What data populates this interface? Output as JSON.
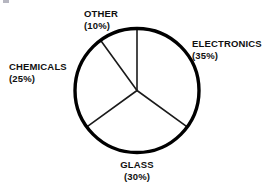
{
  "chart_data": {
    "type": "pie",
    "title": "",
    "subtitle": "",
    "xlabel": "",
    "ylabel": "",
    "legend_position": "none",
    "grid": false,
    "units": "percent",
    "start_angle_deg": 0,
    "direction": "clockwise",
    "categories": [
      "ELECTRONICS",
      "GLASS",
      "CHEMICALS",
      "OTHER"
    ],
    "values": [
      35,
      30,
      25,
      10
    ],
    "slices": [
      {
        "name": "ELECTRONICS",
        "value": 35,
        "label_name": "ELECTRONICS",
        "label_pct": "(35%)",
        "start_deg": 0,
        "end_deg": 126,
        "fill": "#ffffff"
      },
      {
        "name": "GLASS",
        "value": 30,
        "label_name": "GLASS",
        "label_pct": "(30%)",
        "start_deg": 126,
        "end_deg": 234,
        "fill": "#ffffff"
      },
      {
        "name": "CHEMICALS",
        "value": 25,
        "label_name": "CHEMICALS",
        "label_pct": "(25%)",
        "start_deg": 234,
        "end_deg": 324,
        "fill": "#ffffff"
      },
      {
        "name": "OTHER",
        "value": 10,
        "label_name": "OTHER",
        "label_pct": "(10%)",
        "start_deg": 324,
        "end_deg": 360,
        "fill": "#ffffff"
      }
    ],
    "colors": {
      "background": "#ffffff",
      "outline": "#000000",
      "divider": "#1a1a1a",
      "text": "#101010",
      "slice_fill": "#ffffff"
    },
    "geometry": {
      "center_x": 137,
      "center_y": 90.5,
      "radius": 62,
      "outline_width": 3.4,
      "divider_width": 1.6
    }
  }
}
